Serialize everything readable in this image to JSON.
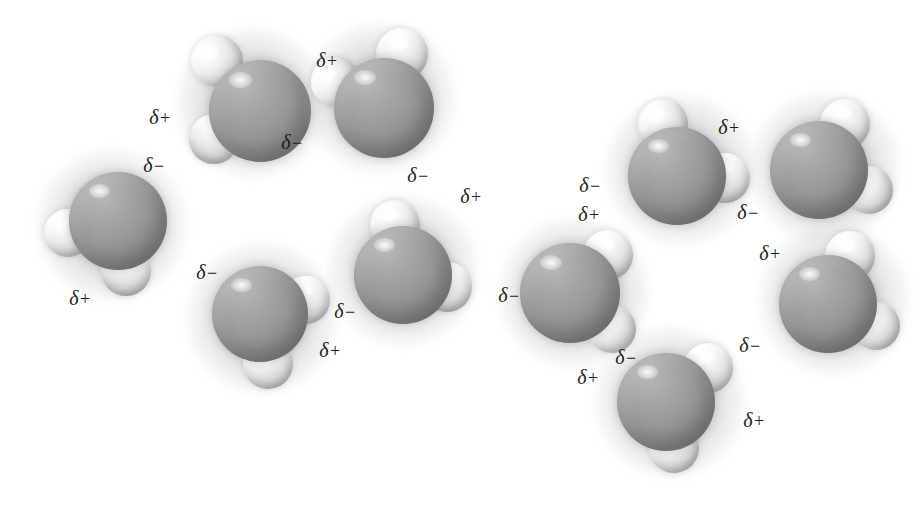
{
  "figure": {
    "background_color": "#ffffff",
    "oxygen_color": "#979797",
    "hydrogen_color": "#e8e8e8",
    "label_color": "#1b1b1b",
    "width": 921,
    "height": 505
  },
  "symbols": {
    "delta": "δ",
    "positive": "+",
    "negative": "−"
  },
  "molecules": [
    {
      "id": "molecule-1",
      "name": "water-molecule-top-left",
      "x": 252,
      "y": 103,
      "oxygen": {
        "dx": 8,
        "dy": 8,
        "size": 102
      },
      "hydrogens": [
        {
          "dx": -35,
          "dy": -42,
          "size": 52,
          "rot": -20
        },
        {
          "dx": -38,
          "dy": 36,
          "size": 50,
          "rot": 25
        }
      ]
    },
    {
      "id": "molecule-2",
      "name": "water-molecule-upper-center",
      "x": 380,
      "y": 98,
      "oxygen": {
        "dx": 4,
        "dy": 10,
        "size": 100
      },
      "hydrogens": [
        {
          "dx": 22,
          "dy": -44,
          "size": 52,
          "rot": 10
        },
        {
          "dx": -44,
          "dy": -16,
          "size": 50,
          "rot": -30
        }
      ]
    },
    {
      "id": "molecule-3",
      "name": "water-molecule-far-left",
      "x": 112,
      "y": 225,
      "oxygen": {
        "dx": 6,
        "dy": -4,
        "size": 98
      },
      "hydrogens": [
        {
          "dx": -44,
          "dy": 8,
          "size": 48,
          "rot": -5
        },
        {
          "dx": 14,
          "dy": 46,
          "size": 50,
          "rot": 20
        }
      ]
    },
    {
      "id": "molecule-4",
      "name": "water-molecule-left-lower",
      "x": 262,
      "y": 318,
      "oxygen": {
        "dx": -2,
        "dy": -4,
        "size": 96
      },
      "hydrogens": [
        {
          "dx": 44,
          "dy": -18,
          "size": 48,
          "rot": 15
        },
        {
          "dx": 6,
          "dy": 46,
          "size": 50,
          "rot": 5
        }
      ]
    },
    {
      "id": "molecule-5",
      "name": "water-molecule-center",
      "x": 403,
      "y": 271,
      "oxygen": {
        "dx": 0,
        "dy": 4,
        "size": 98
      },
      "hydrogens": [
        {
          "dx": -8,
          "dy": -46,
          "size": 50,
          "rot": 0
        },
        {
          "dx": 44,
          "dy": 16,
          "size": 50,
          "rot": 20
        }
      ]
    },
    {
      "id": "molecule-6",
      "name": "water-molecule-center-right",
      "x": 574,
      "y": 293,
      "oxygen": {
        "dx": -4,
        "dy": 0,
        "size": 100
      },
      "hydrogens": [
        {
          "dx": 34,
          "dy": -38,
          "size": 50,
          "rot": 12
        },
        {
          "dx": 38,
          "dy": 36,
          "size": 48,
          "rot": -12
        }
      ]
    },
    {
      "id": "molecule-7",
      "name": "water-molecule-upper-right",
      "x": 681,
      "y": 170,
      "oxygen": {
        "dx": -4,
        "dy": 6,
        "size": 98
      },
      "hydrogens": [
        {
          "dx": -18,
          "dy": -46,
          "size": 50,
          "rot": -10
        },
        {
          "dx": 44,
          "dy": 8,
          "size": 50,
          "rot": 15
        }
      ]
    },
    {
      "id": "molecule-8",
      "name": "water-molecule-far-right-top",
      "x": 825,
      "y": 168,
      "oxygen": {
        "dx": -6,
        "dy": 2,
        "size": 98
      },
      "hydrogens": [
        {
          "dx": 20,
          "dy": -44,
          "size": 50,
          "rot": 10
        },
        {
          "dx": 44,
          "dy": 22,
          "size": 48,
          "rot": -15
        }
      ]
    },
    {
      "id": "molecule-9",
      "name": "water-molecule-far-right-bottom",
      "x": 834,
      "y": 300,
      "oxygen": {
        "dx": -6,
        "dy": 4,
        "size": 98
      },
      "hydrogens": [
        {
          "dx": 16,
          "dy": -44,
          "size": 50,
          "rot": 8
        },
        {
          "dx": 42,
          "dy": 26,
          "size": 48,
          "rot": -14
        }
      ]
    },
    {
      "id": "molecule-10",
      "name": "water-molecule-bottom-right",
      "x": 670,
      "y": 402,
      "oxygen": {
        "dx": -4,
        "dy": 0,
        "size": 98
      },
      "hydrogens": [
        {
          "dx": 38,
          "dy": -34,
          "size": 50,
          "rot": 14
        },
        {
          "dx": 4,
          "dy": 46,
          "size": 50,
          "rot": -4
        }
      ]
    }
  ],
  "charge_labels": [
    {
      "name": "charge-label-1",
      "text": "δ+",
      "sign": "+",
      "x": 160,
      "y": 117,
      "molecule": "molecule-1"
    },
    {
      "name": "charge-label-2",
      "text": "δ−",
      "sign": "−",
      "x": 292,
      "y": 142,
      "molecule": "molecule-1"
    },
    {
      "name": "charge-label-3",
      "text": "δ−",
      "sign": "−",
      "x": 154,
      "y": 165,
      "molecule": "molecule-3"
    },
    {
      "name": "charge-label-4",
      "text": "δ+",
      "sign": "+",
      "x": 327,
      "y": 60,
      "molecule": "molecule-2"
    },
    {
      "name": "charge-label-5",
      "text": "δ−",
      "sign": "−",
      "x": 418,
      "y": 175,
      "molecule": "molecule-2"
    },
    {
      "name": "charge-label-6",
      "text": "δ+",
      "sign": "+",
      "x": 80,
      "y": 298,
      "molecule": "molecule-3"
    },
    {
      "name": "charge-label-7",
      "text": "δ−",
      "sign": "−",
      "x": 207,
      "y": 272,
      "molecule": "molecule-4"
    },
    {
      "name": "charge-label-8",
      "text": "δ+",
      "sign": "+",
      "x": 330,
      "y": 350,
      "molecule": "molecule-4"
    },
    {
      "name": "charge-label-9",
      "text": "δ−",
      "sign": "−",
      "x": 345,
      "y": 311,
      "molecule": "molecule-5"
    },
    {
      "name": "charge-label-10",
      "text": "δ+",
      "sign": "+",
      "x": 471,
      "y": 196,
      "molecule": "molecule-5"
    },
    {
      "name": "charge-label-11",
      "text": "δ−",
      "sign": "−",
      "x": 509,
      "y": 295,
      "molecule": "molecule-6"
    },
    {
      "name": "charge-label-12",
      "text": "δ+",
      "sign": "+",
      "x": 589,
      "y": 214,
      "molecule": "molecule-6"
    },
    {
      "name": "charge-label-13",
      "text": "δ−",
      "sign": "−",
      "x": 626,
      "y": 357,
      "molecule": "molecule-6"
    },
    {
      "name": "charge-label-14",
      "text": "δ+",
      "sign": "+",
      "x": 588,
      "y": 377,
      "molecule": "molecule-10"
    },
    {
      "name": "charge-label-15",
      "text": "δ−",
      "sign": "−",
      "x": 590,
      "y": 185,
      "molecule": "molecule-7"
    },
    {
      "name": "charge-label-16",
      "text": "δ+",
      "sign": "+",
      "x": 729,
      "y": 127,
      "molecule": "molecule-7"
    },
    {
      "name": "charge-label-17",
      "text": "δ−",
      "sign": "−",
      "x": 748,
      "y": 212,
      "molecule": "molecule-8"
    },
    {
      "name": "charge-label-18",
      "text": "δ+",
      "sign": "+",
      "x": 770,
      "y": 253,
      "molecule": "molecule-9"
    },
    {
      "name": "charge-label-19",
      "text": "δ−",
      "sign": "−",
      "x": 750,
      "y": 345,
      "molecule": "molecule-9"
    },
    {
      "name": "charge-label-20",
      "text": "δ+",
      "sign": "+",
      "x": 754,
      "y": 420,
      "molecule": "molecule-10"
    }
  ]
}
